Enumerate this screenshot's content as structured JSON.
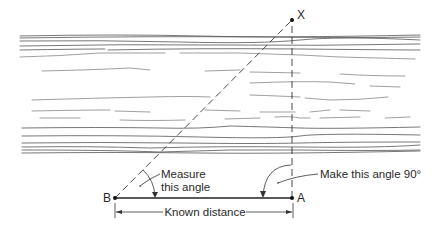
{
  "diagram": {
    "type": "triangulation-across-river",
    "points": {
      "X": {
        "label": "X",
        "x": 292,
        "y": 20
      },
      "B": {
        "label": "B",
        "x": 115,
        "y": 198
      },
      "A": {
        "label": "A",
        "x": 292,
        "y": 198
      }
    },
    "labels": {
      "measure_line1": "Measure",
      "measure_line2": "this angle",
      "right_angle": "Make this angle 90°",
      "known_distance": "Known distance"
    },
    "colors": {
      "ink": "#2a2a2a",
      "background": "#ffffff"
    }
  }
}
